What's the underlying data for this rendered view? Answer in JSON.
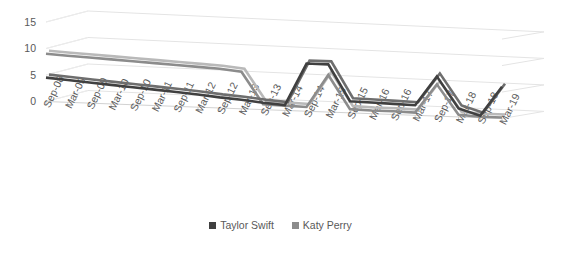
{
  "chart_data": {
    "type": "line",
    "title": "",
    "xlabel": "",
    "ylabel": "",
    "ylim": [
      0,
      15
    ],
    "yticks": [
      0,
      5,
      10,
      15
    ],
    "grid": true,
    "legend_position": "bottom",
    "style": "3d-perspective",
    "categories": [
      "Sep-08",
      "Mar-09",
      "Sep-09",
      "Mar-10",
      "Sep-10",
      "Mar-11",
      "Sep-11",
      "Mar-12",
      "Sep-12",
      "Mar-13",
      "Sep-13",
      "Mar-14",
      "Sep-14",
      "Mar-15",
      "Sep-15",
      "Mar-16",
      "Sep-16",
      "Mar-17",
      "Sep-17",
      "Mar-18",
      "Sep-18",
      "Mar-19"
    ],
    "series": [
      {
        "name": "Taylor Swift",
        "color": "#404040",
        "values": [
          4.5,
          4.2,
          3.9,
          3.6,
          3.3,
          3.0,
          2.7,
          2.4,
          2.0,
          1.7,
          1.3,
          1.0,
          9.0,
          9.0,
          2.2,
          2.1,
          2.0,
          1.9,
          7.5,
          1.6,
          0.4,
          6.0
        ]
      },
      {
        "name": "Katy Perry",
        "color": "#8c8c8c",
        "values": [
          9.0,
          8.8,
          8.6,
          8.4,
          8.2,
          8.0,
          7.8,
          7.6,
          7.4,
          7.0,
          1.0,
          0.9,
          0.8,
          7.0,
          0.7,
          0.6,
          0.6,
          0.5,
          6.0,
          0.4,
          0.2,
          0.2
        ]
      }
    ]
  },
  "axis": {
    "y_tick_labels": [
      "15",
      "10",
      "5",
      "0"
    ],
    "x_tick_labels": [
      "Sep-08",
      "Mar-09",
      "Sep-09",
      "Mar-10",
      "Sep-10",
      "Mar-11",
      "Sep-11",
      "Mar-12",
      "Sep-12",
      "Mar-13",
      "Sep-13",
      "Mar-14",
      "Sep-14",
      "Mar-15",
      "Sep-15",
      "Mar-16",
      "Sep-16",
      "Mar-17",
      "Sep-17",
      "Mar-18",
      "Sep-18",
      "Mar-19"
    ]
  },
  "legend": {
    "items": [
      {
        "label": "Taylor Swift",
        "color": "#404040"
      },
      {
        "label": "Katy Perry",
        "color": "#8c8c8c"
      }
    ]
  },
  "colors": {
    "background": "#ffffff",
    "gridline": "#e2e2e2",
    "axis_text": "#595959",
    "series_taylor_swift": "#404040",
    "series_katy_perry": "#8c8c8c"
  }
}
